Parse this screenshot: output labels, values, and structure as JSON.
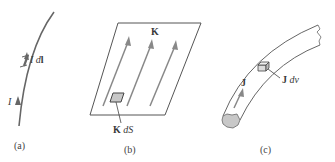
{
  "figure": {
    "panels": [
      {
        "id": "a",
        "caption": "(a)",
        "description": "filamentary current",
        "labels": {
          "current": "I",
          "element_I": "I",
          "element_dl": "dl",
          "element_dl_bold": "l",
          "element_dl_d": "d"
        }
      },
      {
        "id": "b",
        "caption": "(b)",
        "description": "surface current sheet",
        "labels": {
          "surface_density": "K",
          "element_K": "K",
          "element_dS": "dS"
        }
      },
      {
        "id": "c",
        "caption": "(c)",
        "description": "volume current in conductor",
        "labels": {
          "volume_density": "J",
          "element_J": "J",
          "element_dv": "dv"
        }
      }
    ],
    "colors": {
      "line": "#555555",
      "arrow": "#777777",
      "fill_element": "#cccccc",
      "text": "#3a3a3a"
    }
  }
}
